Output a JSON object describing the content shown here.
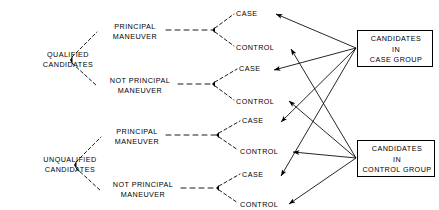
{
  "diagram": {
    "type": "flow-tree",
    "colors": {
      "line": "#000000",
      "background": "#ffffff",
      "text": "#000000"
    },
    "roots": [
      {
        "id": "qualified",
        "line1": "QUALIFIED",
        "line2": "CANDIDATES",
        "branches": [
          {
            "id": "qualified-principal",
            "line1": "PRINCIPAL",
            "line2": "MANEUVER",
            "outcomes": [
              {
                "id": "q-pm-case",
                "label": "CASE",
                "group": "case"
              },
              {
                "id": "q-pm-control",
                "label": "CONTROL",
                "group": "control"
              }
            ]
          },
          {
            "id": "qualified-not-principal",
            "line1": "NOT PRINCIPAL",
            "line2": "MANEUVER",
            "outcomes": [
              {
                "id": "q-npm-case",
                "label": "CASE",
                "group": "case"
              },
              {
                "id": "q-npm-control",
                "label": "CONTROL",
                "group": "control"
              }
            ]
          }
        ]
      },
      {
        "id": "unqualified",
        "line1": "UNQUALIFIED",
        "line2": "CANDIDATES",
        "branches": [
          {
            "id": "unqualified-principal",
            "line1": "PRINCIPAL",
            "line2": "MANEUVER",
            "outcomes": [
              {
                "id": "u-pm-case",
                "label": "CASE",
                "group": "case"
              },
              {
                "id": "u-pm-control",
                "label": "CONTROL",
                "group": "control"
              }
            ]
          },
          {
            "id": "unqualified-not-principal",
            "line1": "NOT PRINCIPAL",
            "line2": "MANEUVER",
            "outcomes": [
              {
                "id": "u-npm-case",
                "label": "CASE",
                "group": "case"
              },
              {
                "id": "u-npm-control",
                "label": "CONTROL",
                "group": "control"
              }
            ]
          }
        ]
      }
    ],
    "groups": [
      {
        "id": "case-group",
        "line1": "CANDIDATES",
        "line2": "IN",
        "line3": "CASE GROUP"
      },
      {
        "id": "control-group",
        "line1": "CANDIDATES",
        "line2": "IN",
        "line3": "CONTROL GROUP"
      }
    ]
  }
}
